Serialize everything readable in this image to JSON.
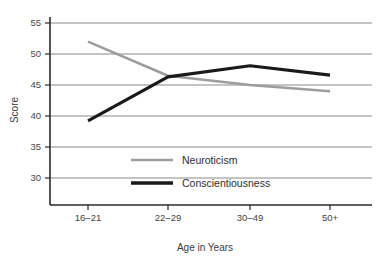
{
  "chart_data": {
    "type": "line",
    "title": "",
    "xlabel": "Age in Years",
    "ylabel": "Score",
    "categories": [
      "16–21",
      "22–29",
      "30–49",
      "50+"
    ],
    "ylim": [
      27,
      56
    ],
    "yticks": [
      30,
      35,
      40,
      45,
      50,
      55
    ],
    "ytick_labels": [
      "30",
      "35",
      "40",
      "45",
      "50",
      "55"
    ],
    "grid": "horizontal",
    "legend_position": "inside-lower-center",
    "series": [
      {
        "name": "Neuroticism",
        "values": [
          52,
          46.5,
          45,
          44
        ],
        "color": "#9d9d9d",
        "line_width": 2.6
      },
      {
        "name": "Conscientiousness",
        "values": [
          39.2,
          46.3,
          48.1,
          46.6
        ],
        "color": "#1a1a1a",
        "line_width": 3.2
      }
    ]
  },
  "axes": {
    "y_label_text": "Score",
    "x_label_text": "Age in Years"
  },
  "legend": {
    "items": [
      {
        "label": "Neuroticism",
        "color": "#9d9d9d",
        "swatch": "line-swatch-gray"
      },
      {
        "label": "Conscientiousness",
        "color": "#1a1a1a",
        "swatch": "line-swatch-black"
      }
    ]
  },
  "colors": {
    "grid": "#8a8a8a",
    "axis": "#2b2b2b",
    "neuroticism": "#9d9d9d",
    "conscientiousness": "#1a1a1a",
    "background": "#ffffff"
  },
  "geometry": {
    "plot_left": 50,
    "plot_right": 372,
    "plot_top": 23,
    "plot_bottom": 205,
    "y_top_value": 55,
    "y_bottom_value": 30,
    "y_top_px": 23,
    "y_bottom_px": 178,
    "x_positions": [
      88,
      168,
      250,
      330
    ]
  }
}
